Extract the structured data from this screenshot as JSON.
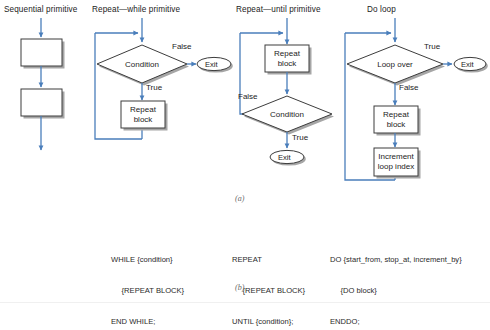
{
  "figure": {
    "part_a_label": "(a)",
    "part_b_label": "(b)"
  },
  "colors": {
    "arrow": "#4a7ebb",
    "shape_border": "#3c3c3c",
    "shadow": "#9a9a9a",
    "text": "#1c1c1c",
    "caption": "#6a6a6a",
    "background": "#ffffff"
  },
  "columns": [
    {
      "id": "sequential",
      "title": "Sequential primitive",
      "nodes": [
        {
          "name": "process-box-1",
          "label": ""
        },
        {
          "name": "process-box-2",
          "label": ""
        }
      ],
      "edge_labels": []
    },
    {
      "id": "repeat-while",
      "title": "Repeat—while primitive",
      "nodes": [
        {
          "name": "condition-diamond",
          "label": "Condition"
        },
        {
          "name": "repeat-block",
          "label": "Repeat\nblock"
        },
        {
          "name": "exit-terminal",
          "label": "Exit"
        }
      ],
      "edge_labels": [
        {
          "name": "false-label",
          "text": "False"
        },
        {
          "name": "true-label",
          "text": "True"
        }
      ]
    },
    {
      "id": "repeat-until",
      "title": "Repeat—until primitive",
      "nodes": [
        {
          "name": "repeat-block",
          "label": "Repeat\nblock"
        },
        {
          "name": "condition-diamond",
          "label": "Condition"
        },
        {
          "name": "exit-terminal",
          "label": "Exit"
        }
      ],
      "edge_labels": [
        {
          "name": "false-label",
          "text": "False"
        },
        {
          "name": "true-label",
          "text": "True"
        }
      ]
    },
    {
      "id": "do-loop",
      "title": "Do loop",
      "nodes": [
        {
          "name": "loop-over-diamond",
          "label": "Loop over"
        },
        {
          "name": "repeat-block",
          "label": "Repeat\nblock"
        },
        {
          "name": "increment-block",
          "label": "Increment\nloop index"
        },
        {
          "name": "exit-terminal",
          "label": "Exit"
        }
      ],
      "edge_labels": [
        {
          "name": "true-label",
          "text": "True"
        },
        {
          "name": "false-label",
          "text": "False"
        }
      ]
    }
  ],
  "node_text": {
    "condition": "Condition",
    "loop_over": "Loop over",
    "repeat_line1": "Repeat",
    "repeat_line2": "block",
    "increment_line1": "Increment",
    "increment_line2": "loop index",
    "exit": "Exit",
    "true": "True",
    "false": "False"
  },
  "pseudocode": [
    {
      "id": "while-code",
      "lines": [
        "WHILE {condition}",
        "     {REPEAT BLOCK}",
        "END WHILE;"
      ]
    },
    {
      "id": "repeat-code",
      "lines": [
        "REPEAT",
        "     {REPEAT BLOCK}",
        "UNTIL {condition};"
      ]
    },
    {
      "id": "do-code",
      "lines": [
        "DO {start_from, stop_at, increment_by}",
        "     {DO block}",
        "ENDDO;"
      ]
    }
  ]
}
